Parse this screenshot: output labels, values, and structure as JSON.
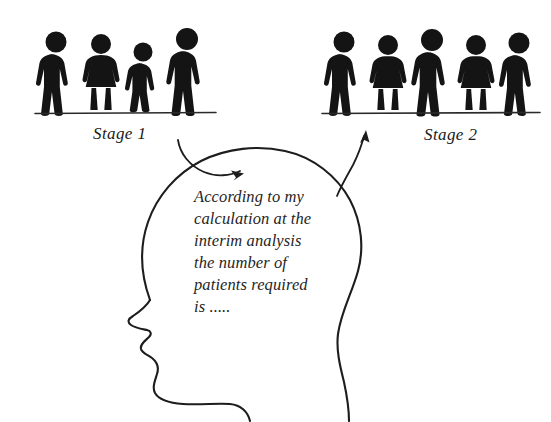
{
  "figure": {
    "background_color": "#ffffff",
    "ink_color": "#141414"
  },
  "stages": [
    {
      "id": "stage-1",
      "label": "Stage 1",
      "patient_count": 4,
      "baseline": {
        "x1": 35,
        "x2": 216,
        "y": 113
      },
      "figures": [
        {
          "type": "man",
          "x": 56,
          "ground": 110,
          "height": 76,
          "label": "man-figure"
        },
        {
          "type": "woman",
          "x": 101,
          "ground": 110,
          "height": 72,
          "label": "woman-figure"
        },
        {
          "type": "man",
          "x": 143,
          "ground": 110,
          "height": 65,
          "label": "short-man-figure"
        },
        {
          "type": "man",
          "x": 187,
          "ground": 110,
          "height": 80,
          "label": "man-figure"
        }
      ]
    },
    {
      "id": "stage-2",
      "label": "Stage 2",
      "patient_count": 5,
      "baseline": {
        "x1": 322,
        "x2": 540,
        "y": 113
      },
      "figures": [
        {
          "type": "man",
          "x": 344,
          "ground": 110,
          "height": 77,
          "label": "man-figure"
        },
        {
          "type": "woman",
          "x": 388,
          "ground": 110,
          "height": 72,
          "label": "woman-figure"
        },
        {
          "type": "man",
          "x": 432,
          "ground": 110,
          "height": 80,
          "label": "man-figure"
        },
        {
          "type": "woman",
          "x": 476,
          "ground": 110,
          "height": 72,
          "label": "woman-figure"
        },
        {
          "type": "man",
          "x": 519,
          "ground": 110,
          "height": 76,
          "label": "man-figure"
        }
      ]
    }
  ],
  "stage_label_positions": {
    "stage_1": {
      "x": 93,
      "y": 139
    },
    "stage_2": {
      "x": 424,
      "y": 140
    }
  },
  "thought": {
    "lines": [
      "According to my",
      "calculation at the",
      "interim analysis",
      "the number of",
      "patients required",
      "is ....."
    ],
    "origin": {
      "x": 194,
      "y": 202
    },
    "line_height": 22
  },
  "arrows": [
    {
      "id": "arrow-stage1-to-head",
      "from": "Stage 1",
      "to": "head",
      "direction": "down-right",
      "tip": {
        "x": 243,
        "y": 172
      }
    },
    {
      "id": "arrow-head-to-stage2",
      "from": "head",
      "to": "Stage 2",
      "direction": "up-right",
      "tip": {
        "x": 366,
        "y": 131
      }
    }
  ],
  "head": {
    "description": "left-facing human head profile silhouette outline",
    "facing": "left"
  }
}
